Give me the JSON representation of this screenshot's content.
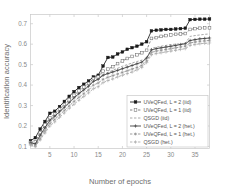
{
  "chart_data": {
    "type": "line",
    "title": "",
    "xlabel": "Number of epochs",
    "ylabel": "Identification accuracy",
    "xlim": [
      1,
      38
    ],
    "ylim": [
      0.09,
      0.745
    ],
    "xticks": [
      5,
      10,
      15,
      20,
      25,
      30,
      35
    ],
    "yticks": [
      0.1,
      0.2,
      0.3,
      0.4,
      0.5,
      0.6,
      0.7
    ],
    "xticklabels": [
      "5",
      "10",
      "15",
      "20",
      "25",
      "30",
      "35"
    ],
    "yticklabels": [
      "0.1",
      "0.2",
      "0.3",
      "0.4",
      "0.5",
      "0.6",
      "0.7"
    ],
    "grid": false,
    "legend_position": "lower right",
    "x": [
      1,
      2,
      3,
      4,
      5,
      6,
      7,
      8,
      9,
      10,
      11,
      12,
      13,
      14,
      15,
      16,
      17,
      18,
      19,
      20,
      21,
      22,
      23,
      24,
      25,
      26,
      27,
      28,
      29,
      30,
      31,
      32,
      33,
      34,
      35,
      36,
      37,
      38
    ],
    "series": [
      {
        "name": "UVeQFed, L = 2 (iid)",
        "color": "#1a1a1a",
        "linestyle": "solid",
        "marker": "square-filled",
        "values": [
          0.128,
          0.143,
          0.185,
          0.222,
          0.262,
          0.272,
          0.295,
          0.32,
          0.345,
          0.368,
          0.388,
          0.404,
          0.42,
          0.44,
          0.448,
          0.493,
          0.535,
          0.537,
          0.552,
          0.562,
          0.575,
          0.583,
          0.59,
          0.6,
          0.612,
          0.665,
          0.668,
          0.67,
          0.672,
          0.672,
          0.674,
          0.676,
          0.678,
          0.72,
          0.721,
          0.722,
          0.722,
          0.723
        ]
      },
      {
        "name": "UVeQFed, L = 1 (iid)",
        "color": "#6e6e6e",
        "linestyle": "dashed",
        "marker": "square-open",
        "values": [
          0.12,
          0.122,
          0.168,
          0.205,
          0.24,
          0.258,
          0.282,
          0.305,
          0.328,
          0.35,
          0.372,
          0.39,
          0.408,
          0.432,
          0.44,
          0.468,
          0.478,
          0.49,
          0.505,
          0.518,
          0.53,
          0.54,
          0.548,
          0.558,
          0.57,
          0.628,
          0.632,
          0.638,
          0.642,
          0.645,
          0.648,
          0.65,
          0.652,
          0.672,
          0.676,
          0.678,
          0.68,
          0.68
        ]
      },
      {
        "name": "QSGD (iid)",
        "color": "#9a9a9a",
        "linestyle": "dashed",
        "marker": "none",
        "values": [
          0.112,
          0.105,
          0.148,
          0.185,
          0.222,
          0.242,
          0.266,
          0.29,
          0.312,
          0.336,
          0.358,
          0.378,
          0.398,
          0.422,
          0.432,
          0.452,
          0.462,
          0.472,
          0.482,
          0.492,
          0.5,
          0.508,
          0.515,
          0.522,
          0.53,
          0.58,
          0.585,
          0.59,
          0.594,
          0.598,
          0.6,
          0.602,
          0.605,
          0.638,
          0.642,
          0.645,
          0.648,
          0.65
        ]
      },
      {
        "name": "UVeQFed, L = 2 (het.)",
        "color": "#3a3a3a",
        "linestyle": "solid",
        "marker": "plus",
        "values": [
          0.118,
          0.112,
          0.155,
          0.192,
          0.228,
          0.248,
          0.27,
          0.292,
          0.315,
          0.338,
          0.358,
          0.376,
          0.394,
          0.418,
          0.428,
          0.448,
          0.456,
          0.464,
          0.472,
          0.48,
          0.488,
          0.496,
          0.504,
          0.512,
          0.532,
          0.572,
          0.578,
          0.582,
          0.586,
          0.59,
          0.594,
          0.598,
          0.602,
          0.618,
          0.622,
          0.626,
          0.628,
          0.63
        ]
      },
      {
        "name": "UVeQFed, L = 1 (het.)",
        "color": "#8c8c8c",
        "linestyle": "dashed",
        "marker": "star",
        "values": [
          0.11,
          0.102,
          0.14,
          0.176,
          0.212,
          0.232,
          0.254,
          0.276,
          0.298,
          0.32,
          0.34,
          0.358,
          0.376,
          0.4,
          0.41,
          0.428,
          0.438,
          0.446,
          0.454,
          0.462,
          0.47,
          0.478,
          0.486,
          0.496,
          0.518,
          0.56,
          0.566,
          0.57,
          0.574,
          0.578,
          0.582,
          0.586,
          0.59,
          0.606,
          0.61,
          0.614,
          0.616,
          0.618
        ]
      },
      {
        "name": "QSGD (het.)",
        "color": "#a8a8a8",
        "linestyle": "dashed",
        "marker": "plus",
        "values": [
          0.108,
          0.1,
          0.132,
          0.166,
          0.2,
          0.22,
          0.242,
          0.264,
          0.286,
          0.306,
          0.326,
          0.344,
          0.362,
          0.382,
          0.392,
          0.412,
          0.422,
          0.43,
          0.44,
          0.448,
          0.456,
          0.464,
          0.474,
          0.486,
          0.51,
          0.548,
          0.554,
          0.558,
          0.562,
          0.566,
          0.57,
          0.574,
          0.578,
          0.594,
          0.598,
          0.602,
          0.604,
          0.606
        ]
      }
    ]
  }
}
